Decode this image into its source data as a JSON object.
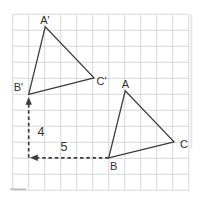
{
  "colors": {
    "background": "#ffffff",
    "grid": "#d9d9d9",
    "grid_dark_segment": "#bcbcbc",
    "edge_shadow": "#e9e9e9",
    "line": "#3c3c3c",
    "text": "#333333"
  },
  "grid": {
    "x0": 12.7,
    "y0": 14.3,
    "cols": 11,
    "rows": 11,
    "cell": 16
  },
  "triangles": [
    {
      "id": "image-triangle",
      "vertices": [
        {
          "label": "A'",
          "x": 45.3,
          "y": 26.7,
          "lx": 45,
          "ly": 24
        },
        {
          "label": "B'",
          "x": 28.7,
          "y": 94.3,
          "lx": 18.5,
          "ly": 91
        },
        {
          "label": "C'",
          "x": 94,
          "y": 77.8,
          "lx": 101.5,
          "ly": 85
        }
      ]
    },
    {
      "id": "original-triangle",
      "vertices": [
        {
          "label": "A",
          "x": 125.3,
          "y": 90.7,
          "lx": 125.3,
          "ly": 88
        },
        {
          "label": "B",
          "x": 108.7,
          "y": 157.8,
          "lx": 113.7,
          "ly": 170
        },
        {
          "label": "C",
          "x": 174,
          "y": 141.8,
          "lx": 184,
          "ly": 147.5
        }
      ]
    }
  ],
  "translation_arrows": [
    {
      "id": "up-arrow",
      "direction": "up",
      "label": "4",
      "x1": 28.7,
      "y1": 157.8,
      "x2": 28.7,
      "y2": 97,
      "lx": 41,
      "ly": 135.5
    },
    {
      "id": "left-arrow",
      "direction": "left",
      "label": "5",
      "x1": 108.7,
      "y1": 157.8,
      "x2": 30,
      "y2": 157.8,
      "lx": 64,
      "ly": 150.5
    }
  ],
  "style": {
    "line_width": 1.3,
    "dash_width": 1.7,
    "dash_pattern": "3.5 2.8",
    "vertex_font_size": 11,
    "number_font_size": 12.5,
    "arrow_len": 7.8,
    "arrow_halfwidth": 3.2
  }
}
